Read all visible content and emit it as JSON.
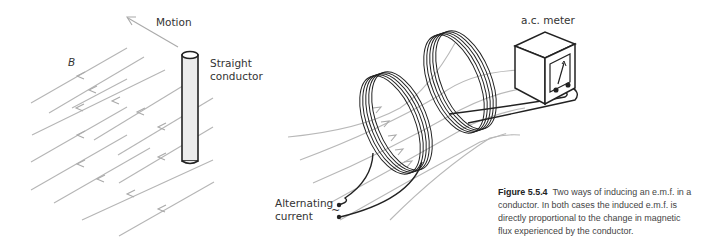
{
  "figure": {
    "number": "Figure 5.5.4",
    "caption": "Two ways of inducing an e.m.f. in a conductor. In both cases the induced e.m.f. is directly proportional to the change in magnetic flux experienced by the conductor."
  },
  "left_diagram": {
    "motion_label": "Motion",
    "field_label": "B",
    "conductor_label_line1": "Straight",
    "conductor_label_line2": "conductor"
  },
  "right_diagram": {
    "meter_label": "a.c. meter",
    "source_label_line1": "Alternating",
    "source_label_line2": "current",
    "source_symbol": "~"
  },
  "colors": {
    "field_lines": "#b0b0b0",
    "wire": "#222222",
    "text": "#333333"
  }
}
